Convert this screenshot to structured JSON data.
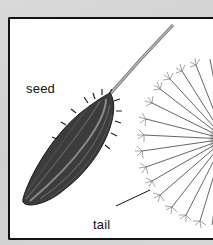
{
  "illustration": {
    "subject": "dandelion seed diagram",
    "labels": {
      "seed": "seed",
      "tail": "tail"
    }
  },
  "colors": {
    "background": "#d4d4d4",
    "panel": "#ffffff",
    "border": "#111111",
    "seed_dark": "#3a3a3a",
    "seed_mid": "#6e6e6e",
    "stalk": "#9a9a9a"
  }
}
